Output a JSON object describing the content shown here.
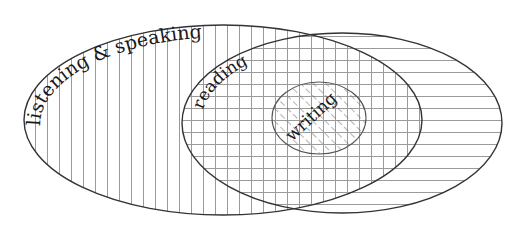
{
  "diagram": {
    "type": "nested-venn",
    "colors": {
      "background": "#ffffff",
      "outline": "#333333",
      "hatch": "#9a9a9a",
      "text": "#1a1a1a"
    },
    "regions": [
      {
        "id": "listening-speaking",
        "label": "listening & speaking",
        "pattern": "vertical-lines",
        "shape": {
          "cx": 223,
          "cy": 120,
          "rx": 199,
          "ry": 95
        }
      },
      {
        "id": "reading",
        "label": "reading",
        "pattern": "horizontal-lines",
        "shape": {
          "cx": 342,
          "cy": 123,
          "rx": 160,
          "ry": 90
        },
        "note": "overlap with listening & speaking shows grid"
      },
      {
        "id": "writing",
        "label": "writing",
        "pattern": "diagonal-lines",
        "shape": {
          "cx": 319,
          "cy": 118,
          "rx": 47,
          "ry": 36
        }
      }
    ],
    "labels": {
      "listening_speaking": "listening & speaking",
      "reading": "reading",
      "writing": "writing"
    }
  }
}
